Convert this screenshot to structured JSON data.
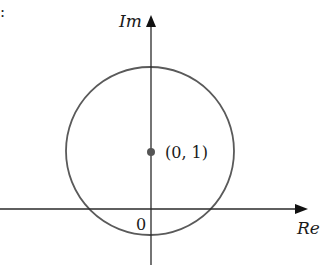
{
  "figure": {
    "corner_mark": ":",
    "axes": {
      "imaginary_label": "Im",
      "real_label": "Re",
      "origin_label": "0"
    },
    "circle": {
      "center_label": "(0, 1)",
      "center": [
        0,
        1
      ],
      "radius": 1.4
    },
    "colors": {
      "axis": "#2a2a2a",
      "circle": "#5a5a5a",
      "point": "#555555",
      "text": "#1a1a1a"
    }
  }
}
